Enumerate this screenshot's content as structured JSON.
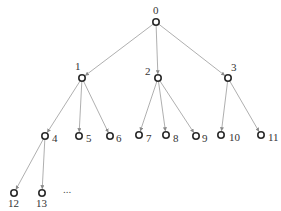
{
  "diagram": {
    "type": "tree",
    "colors": {
      "edge": "#9a9a9a",
      "node_stroke": "#2a2a2a",
      "label": "#333333"
    },
    "nodes": [
      {
        "id": "0",
        "label": "0",
        "x": 156,
        "y": 22,
        "lx": 153,
        "ly": 14
      },
      {
        "id": "1",
        "label": "1",
        "x": 82,
        "y": 78,
        "lx": 75,
        "ly": 70
      },
      {
        "id": "2",
        "label": "2",
        "x": 158,
        "y": 78,
        "lx": 145,
        "ly": 75
      },
      {
        "id": "3",
        "label": "3",
        "x": 228,
        "y": 78,
        "lx": 231,
        "ly": 71
      },
      {
        "id": "4",
        "label": "4",
        "x": 45,
        "y": 136,
        "lx": 52,
        "ly": 142
      },
      {
        "id": "5",
        "label": "5",
        "x": 79,
        "y": 136,
        "lx": 86,
        "ly": 142
      },
      {
        "id": "6",
        "label": "6",
        "x": 110,
        "y": 136,
        "lx": 116,
        "ly": 142
      },
      {
        "id": "7",
        "label": "7",
        "x": 139,
        "y": 135,
        "lx": 146,
        "ly": 142
      },
      {
        "id": "8",
        "label": "8",
        "x": 166,
        "y": 135,
        "lx": 173,
        "ly": 142
      },
      {
        "id": "9",
        "label": "9",
        "x": 196,
        "y": 136,
        "lx": 202,
        "ly": 142
      },
      {
        "id": "10",
        "label": "10",
        "x": 221,
        "y": 135,
        "lx": 229,
        "ly": 141
      },
      {
        "id": "11",
        "label": "11",
        "x": 261,
        "y": 135,
        "lx": 268,
        "ly": 141
      },
      {
        "id": "12",
        "label": "12",
        "x": 14,
        "y": 193,
        "lx": 8,
        "ly": 207
      },
      {
        "id": "13",
        "label": "13",
        "x": 42,
        "y": 193,
        "lx": 36,
        "ly": 207
      }
    ],
    "edges": [
      [
        "0",
        "1"
      ],
      [
        "0",
        "2"
      ],
      [
        "0",
        "3"
      ],
      [
        "1",
        "4"
      ],
      [
        "1",
        "5"
      ],
      [
        "1",
        "6"
      ],
      [
        "2",
        "7"
      ],
      [
        "2",
        "8"
      ],
      [
        "2",
        "9"
      ],
      [
        "3",
        "10"
      ],
      [
        "3",
        "11"
      ],
      [
        "4",
        "12"
      ],
      [
        "4",
        "13"
      ]
    ],
    "ellipsis": {
      "text": "...",
      "x": 63,
      "y": 193
    }
  }
}
